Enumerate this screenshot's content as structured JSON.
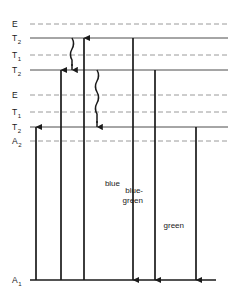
{
  "diagram": {
    "colors": {
      "solid_level": "#4d4d4d",
      "dashed_level": "#9a9a9a",
      "arrow": "#1a1a1a",
      "baseline": "#1a1a1a",
      "background": "#ffffff"
    }
  },
  "chart_data": {
    "type": "diagram",
    "title": "",
    "xlabel": "",
    "ylabel": "",
    "levels": [
      {
        "id": "level-e-1",
        "label": "E",
        "subscript": "",
        "y": 24,
        "style": "dashed",
        "x_start": 30,
        "x_end": 228
      },
      {
        "id": "level-t2-1",
        "label": "T",
        "subscript": "2",
        "y": 38,
        "style": "solid",
        "x_start": 30,
        "x_end": 228
      },
      {
        "id": "level-t1-1",
        "label": "T",
        "subscript": "1",
        "y": 55,
        "style": "dashed",
        "x_start": 30,
        "x_end": 228
      },
      {
        "id": "level-t2-2",
        "label": "T",
        "subscript": "2",
        "y": 70,
        "style": "solid",
        "x_start": 30,
        "x_end": 228
      },
      {
        "id": "level-e-2",
        "label": "E",
        "subscript": "",
        "y": 95,
        "style": "dashed",
        "x_start": 30,
        "x_end": 228
      },
      {
        "id": "level-t1-2",
        "label": "T",
        "subscript": "1",
        "y": 112,
        "style": "dashed",
        "x_start": 30,
        "x_end": 228
      },
      {
        "id": "level-t2-3",
        "label": "T",
        "subscript": "2",
        "y": 127,
        "style": "solid",
        "x_start": 30,
        "x_end": 228
      },
      {
        "id": "level-a2",
        "label": "A",
        "subscript": "2",
        "y": 141,
        "style": "dashed",
        "x_start": 30,
        "x_end": 228
      },
      {
        "id": "level-a1",
        "label": "A",
        "subscript": "1",
        "y": 280,
        "style": "baseline",
        "x_start": 30,
        "x_end": 216
      }
    ],
    "excitation_arrows": [
      {
        "id": "excitation-1",
        "x": 36,
        "y_from": 280,
        "y_to": 127,
        "direction": "up"
      },
      {
        "id": "excitation-2",
        "x": 61,
        "y_from": 280,
        "y_to": 70,
        "direction": "up"
      },
      {
        "id": "excitation-3",
        "x": 84,
        "y_from": 280,
        "y_to": 38,
        "direction": "up"
      }
    ],
    "nonradiative_arrows": [
      {
        "id": "nonradiative-1",
        "x": 72,
        "y_from": 38,
        "y_to": 70,
        "direction": "down",
        "style": "wavy"
      },
      {
        "id": "nonradiative-2",
        "x": 97,
        "y_from": 70,
        "y_to": 127,
        "direction": "down",
        "style": "wavy"
      }
    ],
    "emission_arrows": [
      {
        "id": "emission-blue",
        "label": "blue",
        "label_lines": [
          "blue"
        ],
        "x": 133,
        "y_from": 38,
        "y_to": 280,
        "direction": "down",
        "label_x": 120,
        "label_y": 186
      },
      {
        "id": "emission-blue-green",
        "label": "blue-green",
        "label_lines": [
          "blue-",
          "green"
        ],
        "x": 155,
        "y_from": 70,
        "y_to": 280,
        "direction": "down",
        "label_x": 143,
        "label_y": 193
      },
      {
        "id": "emission-green",
        "label": "green",
        "label_lines": [
          "green"
        ],
        "x": 196,
        "y_from": 127,
        "y_to": 280,
        "direction": "down",
        "label_x": 184,
        "label_y": 228
      }
    ],
    "label_column_x": 12,
    "legend": [],
    "grid": false
  }
}
